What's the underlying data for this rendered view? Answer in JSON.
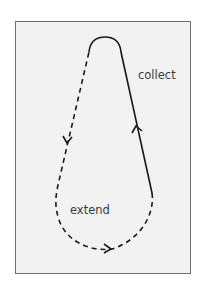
{
  "diagram": {
    "type": "loop-cycle",
    "labels": {
      "collect": "collect",
      "extend": "extend"
    },
    "segments": [
      {
        "name": "collect",
        "style": "solid",
        "direction": "up",
        "side": "right"
      },
      {
        "name": "extend",
        "style": "dashed",
        "direction": "down-around-and-up",
        "side": "left-bottom"
      }
    ],
    "arrows": [
      {
        "name": "left-down-arrow",
        "direction": "down"
      },
      {
        "name": "right-up-arrow",
        "direction": "up"
      },
      {
        "name": "bottom-right-arrow",
        "direction": "right"
      }
    ],
    "colors": {
      "background": "#f2f2f2",
      "border": "#6e6e6e",
      "stroke": "#1a1a1a",
      "text": "#3a3a3a"
    }
  }
}
